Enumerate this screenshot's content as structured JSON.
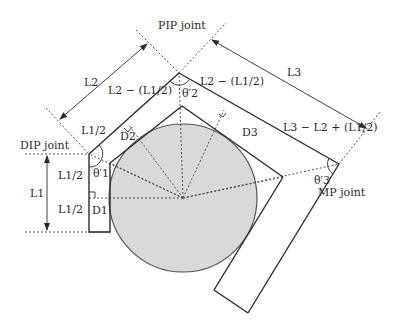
{
  "colors": {
    "stroke": "#2b2b2b",
    "dotted": "#444444",
    "circle_fill": "#d9d9d9",
    "circle_stroke": "#555555",
    "text": "#2a2a2a"
  },
  "joints": {
    "dip": "DIP joint",
    "pip": "PIP joint",
    "mp": "MP joint"
  },
  "dimensions": {
    "l1": "L1",
    "l2": "L2",
    "l3": "L3",
    "l1_half_a": "L1/2",
    "l1_half_b": "L1/2",
    "l1_half_c": "L1/2",
    "l2_minus_half_l1_a": "L2 − (L1/2)",
    "l2_minus_half_l1_b": "L2 − (L1/2)",
    "l3_minus_l2_plus_half_l1": "L3 − L2 + (L1/2)"
  },
  "distances": {
    "d1": "D1",
    "d2": "D2",
    "d3": "D3"
  },
  "angles": {
    "theta1": "θ′1",
    "theta2": "θ′2",
    "theta3": "θ′3"
  }
}
